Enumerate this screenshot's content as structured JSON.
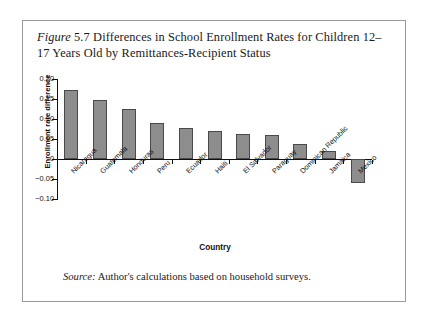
{
  "figure": {
    "label_italic": "Figure",
    "number": "5.7",
    "title_rest": "Differences in School Enrollment Rates for Children 12–17 Years Old by Remittances-Recipient Status",
    "title_line1": "Differences in School Enrollment Rates for",
    "title_line2": "Children 12–17 Years Old by Remittances-Recipient Status",
    "source_label": "Source:",
    "source_text": " Author's calculations based on household surveys."
  },
  "colors": {
    "bar_fill": "#8d8d8d",
    "bar_stroke": "#4a4a4a",
    "axis": "#111111",
    "frame": "#9a9a9a",
    "background": "#ffffff"
  },
  "chart_data": {
    "type": "bar",
    "title": "Figure 5.7 Differences in School Enrollment Rates for Children 12–17 Years Old by Remittances-Recipient Status",
    "xlabel": "Country",
    "ylabel": "Enrollment rate difference",
    "ylim": [
      -0.1,
      0.2
    ],
    "yticks": [
      0.2,
      0.15,
      0.1,
      0.05,
      0,
      -0.05,
      -0.1
    ],
    "ytick_labels": [
      "0.20",
      "0.15",
      "0.10",
      "0.05",
      "0",
      "−0.05",
      "−0.10"
    ],
    "grid": false,
    "legend": null,
    "categories": [
      "Nicaragua",
      "Guatemala",
      "Honduras",
      "Peru",
      "Ecuador",
      "Haiti",
      "El Salvador",
      "Paraguay",
      "Dominican Republic",
      "Jamaica",
      "Mexico"
    ],
    "values": [
      0.173,
      0.148,
      0.124,
      0.089,
      0.077,
      0.07,
      0.063,
      0.06,
      0.038,
      0.02,
      -0.06
    ]
  }
}
